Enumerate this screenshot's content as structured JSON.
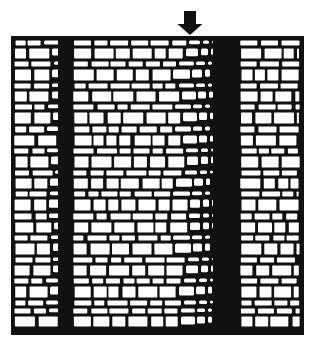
{
  "figure": {
    "colors": {
      "ink": "#111111",
      "paper": "#ffffff"
    },
    "arrow": {
      "x": 190,
      "top": 11,
      "tip": 35,
      "shaft_width": 12,
      "head_width": 25,
      "head_height": 11
    },
    "grid": {
      "x": 11,
      "y": 36,
      "width": 293,
      "height": 299,
      "border": 3
    },
    "row_pattern": [
      8,
      13,
      8,
      14,
      8,
      13,
      8,
      14,
      9,
      13,
      8,
      14,
      8,
      13,
      8,
      14,
      9,
      13,
      8,
      14,
      8,
      13,
      8,
      14,
      8
    ],
    "bands": [
      {
        "name": "latewood-band-1",
        "fade_start": 40,
        "solid_start": 58,
        "solid_end": 73
      },
      {
        "name": "latewood-band-2",
        "fade_start": 172,
        "solid_start": 213,
        "solid_end": 240
      }
    ],
    "earlywood_cell_width": 18,
    "latewood_cell_width": 6
  }
}
